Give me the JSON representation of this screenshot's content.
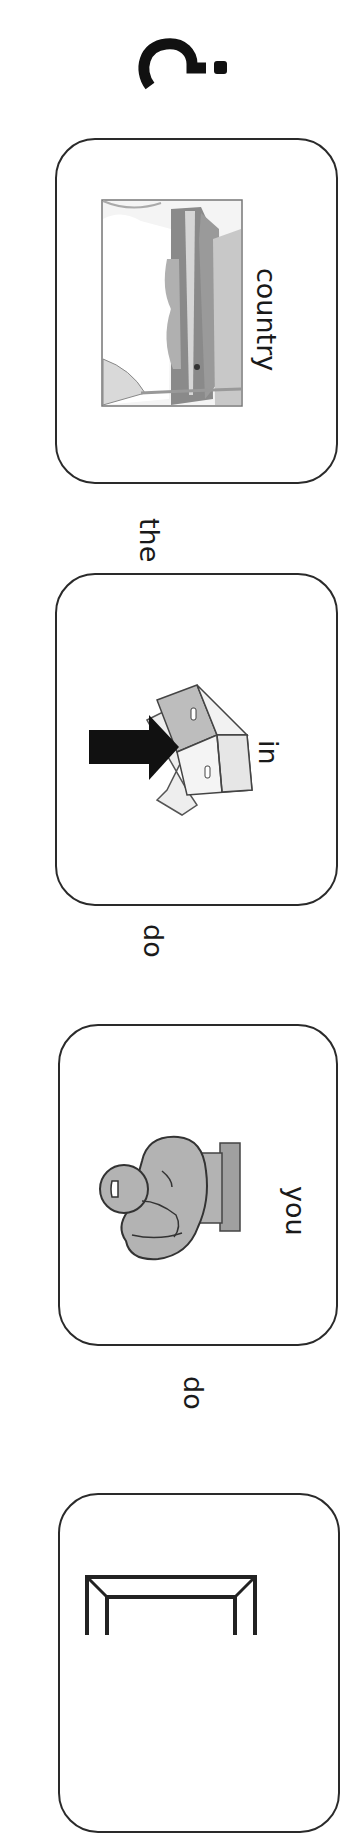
{
  "sentence_strip": {
    "orientation": "rotated-90-clockwise",
    "reading_order_words": [
      "do",
      "you",
      "do",
      "in",
      "the",
      "country",
      "?"
    ],
    "cards": [
      {
        "label": "country",
        "icon": "countryside-landscape-icon"
      },
      {
        "label": "in",
        "icon": "arrow-into-box-icon"
      },
      {
        "label": "you",
        "icon": "pointing-hand-icon"
      },
      {
        "label": "",
        "icon": "frame-box-icon"
      }
    ],
    "connectors": [
      {
        "text": "the"
      },
      {
        "text": "do"
      },
      {
        "text": "do"
      }
    ],
    "end_punctuation": "?",
    "colors": {
      "border": "#2a2a2a",
      "text": "#1a1a1a",
      "symbol_gray": "#a9a9a9",
      "symbol_dark": "#111111"
    }
  }
}
